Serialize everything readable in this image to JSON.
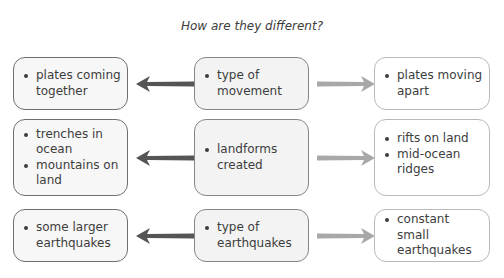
{
  "title": "How are they different?",
  "rows": [
    {
      "left": [
        "plates coming together"
      ],
      "middle": [
        "type of movement"
      ],
      "right": [
        "plates moving apart"
      ]
    },
    {
      "left": [
        "trenches in ocean",
        "mountains on land"
      ],
      "middle": [
        "landforms created"
      ],
      "right": [
        "rifts on land",
        "mid-ocean ridges"
      ]
    },
    {
      "left": [
        "some larger earthquakes"
      ],
      "middle": [
        "type of earthquakes"
      ],
      "right": [
        "constant small earthquakes"
      ]
    }
  ],
  "colors": {
    "left_arrow": "#555555",
    "right_arrow": "#a8a8a8",
    "left_border": "#6f6f6f",
    "middle_border": "#858585",
    "right_border": "#b9b9b9"
  },
  "icons": {
    "left_arrow": "arrow-left-icon",
    "right_arrow": "arrow-right-icon"
  }
}
